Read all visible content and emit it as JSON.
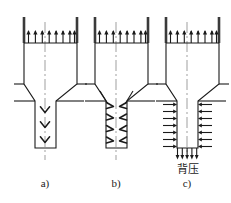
{
  "figure": {
    "type": "engineering-diagram",
    "background_color": "#ffffff",
    "line_color": "#1a1a1a",
    "axis_color": "#9a9a9a",
    "wall_color": "#3a3a3a",
    "panels": [
      {
        "id": "a",
        "caption": "a)",
        "center_x": 45,
        "inlet_arrows": 8,
        "flow_marks": "3 downward chevrons on centerline",
        "flow_mark_count": 3
      },
      {
        "id": "b",
        "caption": "b)",
        "center_x": 116,
        "inlet_arrows": 8,
        "flow_marks": "4 angled chevrons along each inner wall",
        "flow_mark_count": 8
      },
      {
        "id": "c",
        "caption": "c)",
        "center_x": 187,
        "inlet_arrows": 8,
        "flow_marks": "7 inward horizontal arrows per side plus 5 downward arrows at outlet",
        "flow_mark_count": 19,
        "outlet_arrows": 5,
        "side_arrows_per_side": 7,
        "annotation": "背压"
      }
    ],
    "captions": {
      "a": "a)",
      "b": "b)",
      "c": "c)"
    },
    "annotations": {
      "back_pressure": "背压"
    }
  }
}
